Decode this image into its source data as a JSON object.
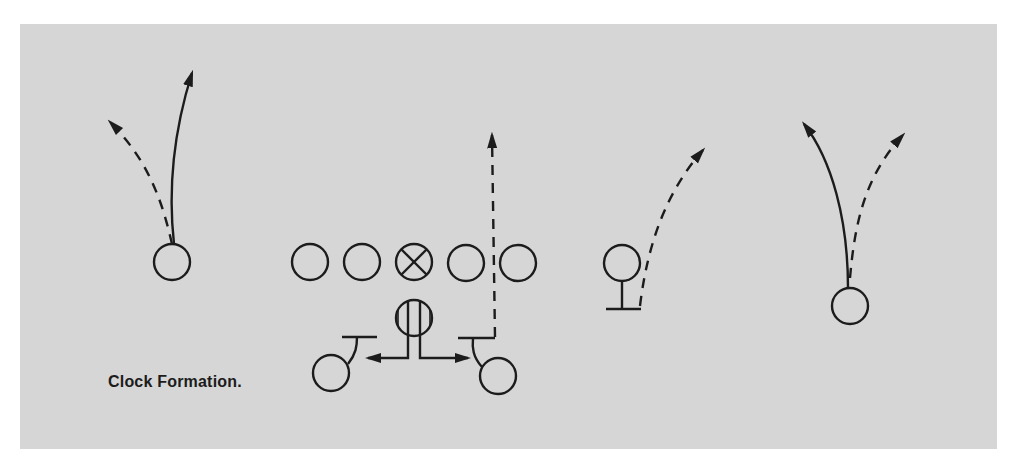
{
  "diagram": {
    "title": "Clock Formation.",
    "type": "football-play-diagram",
    "colors": {
      "background": "#d6d6d6",
      "ink": "#1c1c1c",
      "page": "#ffffff"
    },
    "legend": {
      "solid_line": "route",
      "dashed_line": "alternate route",
      "crossed_circle": "center",
      "striped_circle": "quarterback",
      "circle_with_bar": "blocker stance"
    },
    "players": [
      {
        "id": "left-end",
        "symbol": "circle"
      },
      {
        "id": "lineman-1",
        "symbol": "circle"
      },
      {
        "id": "lineman-2",
        "symbol": "circle"
      },
      {
        "id": "center",
        "symbol": "crossed-circle"
      },
      {
        "id": "lineman-3",
        "symbol": "circle"
      },
      {
        "id": "lineman-4",
        "symbol": "circle"
      },
      {
        "id": "quarterback",
        "symbol": "striped-circle"
      },
      {
        "id": "left-back",
        "symbol": "circle-with-bar"
      },
      {
        "id": "right-back",
        "symbol": "circle-with-bar"
      },
      {
        "id": "wing",
        "symbol": "circle-with-bar"
      },
      {
        "id": "right-end",
        "symbol": "circle"
      }
    ]
  }
}
